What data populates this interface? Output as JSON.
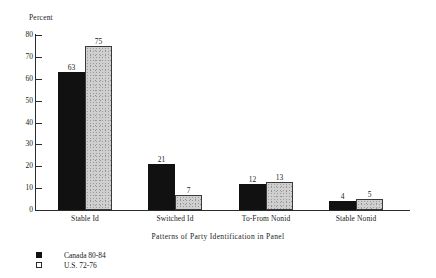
{
  "chart_data": {
    "type": "bar",
    "title": "",
    "xlabel": "Patterns of Party Identification in Panel",
    "ylabel": "Percent",
    "ylim": [
      0,
      80
    ],
    "yticks": [
      0,
      10,
      20,
      30,
      40,
      50,
      60,
      70,
      80
    ],
    "grid": false,
    "legend_position": "bottom-left",
    "categories": [
      "Stable Id",
      "Switched Id",
      "To-From Nonid",
      "Stable Nonid"
    ],
    "series": [
      {
        "name": "Canada 80-84",
        "swatch": "filled-square",
        "color": "#111111",
        "values": [
          63,
          21,
          12,
          4
        ]
      },
      {
        "name": "U.S. 72-76",
        "swatch": "hollow-square",
        "color": "#cfcfcf",
        "values": [
          75,
          7,
          13,
          5
        ]
      }
    ]
  },
  "axis": {
    "y_title": "Percent",
    "x_title": "Patterns of Party Identification in Panel",
    "tick_labels": [
      "0",
      "10",
      "20",
      "30",
      "40",
      "50",
      "60",
      "70",
      "80"
    ]
  },
  "categories": [
    {
      "label": "Stable Id"
    },
    {
      "label": "Switched Id"
    },
    {
      "label": "To-From Nonid"
    },
    {
      "label": "Stable Nonid"
    }
  ],
  "bars": [
    {
      "value_label": "63"
    },
    {
      "value_label": "75"
    },
    {
      "value_label": "21"
    },
    {
      "value_label": "7"
    },
    {
      "value_label": "12"
    },
    {
      "value_label": "13"
    },
    {
      "value_label": "4"
    },
    {
      "value_label": "5"
    }
  ],
  "legend": {
    "items": [
      {
        "label": "Canada 80-84"
      },
      {
        "label": "U.S. 72-76"
      }
    ]
  }
}
